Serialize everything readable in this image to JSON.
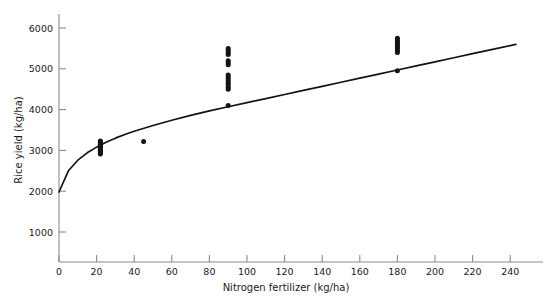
{
  "chart_data": {
    "type": "scatter",
    "title": "",
    "xlabel": "Nitrogen fertilizer (kg/ha)",
    "ylabel": "Rice yield (kg/ha)",
    "xlim": [
      0,
      250
    ],
    "ylim": [
      0,
      6500
    ],
    "xticks": [
      0,
      20,
      40,
      60,
      80,
      100,
      120,
      140,
      160,
      180,
      200,
      220,
      240
    ],
    "yticks": [
      1000,
      2000,
      3000,
      4000,
      5000,
      6000
    ],
    "grid": false,
    "legend": null,
    "point_color": "#141414",
    "curve_color": "#141414",
    "axis_color": "#8c8c8c",
    "series": [
      {
        "name": "Observed rice yield",
        "type": "scatter",
        "points": [
          [
            22,
            3230
          ],
          [
            22,
            3200
          ],
          [
            22,
            3170
          ],
          [
            22,
            3140
          ],
          [
            22,
            3120
          ],
          [
            22,
            3090
          ],
          [
            22,
            3060
          ],
          [
            22,
            3030
          ],
          [
            22,
            3000
          ],
          [
            22,
            2970
          ],
          [
            22,
            2940
          ],
          [
            22,
            2910
          ],
          [
            45,
            3220
          ],
          [
            90,
            5500
          ],
          [
            90,
            5450
          ],
          [
            90,
            5400
          ],
          [
            90,
            5350
          ],
          [
            90,
            5200
          ],
          [
            90,
            5150
          ],
          [
            90,
            5100
          ],
          [
            90,
            4850
          ],
          [
            90,
            4800
          ],
          [
            90,
            4750
          ],
          [
            90,
            4700
          ],
          [
            90,
            4650
          ],
          [
            90,
            4600
          ],
          [
            90,
            4550
          ],
          [
            90,
            4500
          ],
          [
            90,
            4100
          ],
          [
            180,
            5750
          ],
          [
            180,
            5700
          ],
          [
            180,
            5650
          ],
          [
            180,
            5600
          ],
          [
            180,
            5550
          ],
          [
            180,
            5500
          ],
          [
            180,
            5450
          ],
          [
            180,
            5400
          ],
          [
            180,
            4950
          ]
        ]
      },
      {
        "name": "Fitted response curve",
        "type": "line",
        "points": [
          [
            0,
            1980
          ],
          [
            5,
            2500
          ],
          [
            10,
            2760
          ],
          [
            15,
            2940
          ],
          [
            20,
            3080
          ],
          [
            25,
            3200
          ],
          [
            30,
            3300
          ],
          [
            35,
            3390
          ],
          [
            40,
            3470
          ],
          [
            50,
            3610
          ],
          [
            60,
            3740
          ],
          [
            70,
            3860
          ],
          [
            80,
            3970
          ],
          [
            90,
            4070
          ],
          [
            100,
            4170
          ],
          [
            110,
            4270
          ],
          [
            120,
            4370
          ],
          [
            130,
            4470
          ],
          [
            140,
            4570
          ],
          [
            150,
            4670
          ],
          [
            160,
            4770
          ],
          [
            170,
            4870
          ],
          [
            180,
            4970
          ],
          [
            190,
            5070
          ],
          [
            200,
            5170
          ],
          [
            210,
            5270
          ],
          [
            220,
            5370
          ],
          [
            230,
            5470
          ],
          [
            243,
            5600
          ]
        ]
      }
    ]
  }
}
